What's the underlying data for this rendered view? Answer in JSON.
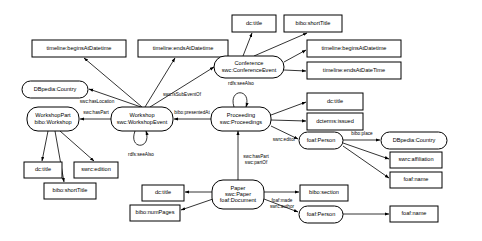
{
  "diagram": {
    "colors": {
      "stroke": "#000000",
      "fill": "#ffffff",
      "text": "#000000"
    },
    "nodes": [
      {
        "id": "dc_title_conf",
        "shape": "rect",
        "x": 232,
        "y": 15,
        "w": 44,
        "h": 17,
        "lines": [
          "dc:title"
        ]
      },
      {
        "id": "bibo_short_conf",
        "shape": "rect",
        "x": 284,
        "y": 15,
        "w": 58,
        "h": 17,
        "lines": [
          "bibo:shortTitle"
        ]
      },
      {
        "id": "tl_begins_left",
        "shape": "rect",
        "x": 32,
        "y": 40,
        "w": 94,
        "h": 17,
        "lines": [
          "timeline:beginsAtDatetime"
        ]
      },
      {
        "id": "tl_ends_left",
        "shape": "rect",
        "x": 138,
        "y": 40,
        "w": 90,
        "h": 17,
        "lines": [
          "timeline:endsAtDatetime"
        ]
      },
      {
        "id": "tl_begins_right",
        "shape": "rect",
        "x": 307,
        "y": 40,
        "w": 94,
        "h": 17,
        "lines": [
          "timeline:beginsAtDatetime"
        ]
      },
      {
        "id": "tl_ends_right",
        "shape": "rect",
        "x": 307,
        "y": 62,
        "w": 94,
        "h": 17,
        "lines": [
          "timeline:endsAtDateTime"
        ]
      },
      {
        "id": "conference",
        "shape": "round",
        "x": 214,
        "y": 56,
        "w": 70,
        "h": 22,
        "lines": [
          "Conference",
          "swc:ConferenceEvent"
        ]
      },
      {
        "id": "dbpedia_country_l",
        "shape": "round",
        "x": 22,
        "y": 81,
        "w": 66,
        "h": 17,
        "lines": [
          "DBpedia:Country"
        ]
      },
      {
        "id": "dc_title_proc",
        "shape": "rect",
        "x": 307,
        "y": 93,
        "w": 56,
        "h": 17,
        "lines": [
          "dc:title"
        ]
      },
      {
        "id": "dcterms_issued",
        "shape": "rect",
        "x": 307,
        "y": 113,
        "w": 56,
        "h": 17,
        "lines": [
          "dcterms:issued"
        ]
      },
      {
        "id": "workshop_part",
        "shape": "round",
        "x": 27,
        "y": 107,
        "w": 52,
        "h": 24,
        "lines": [
          "WorkshopPart",
          "bibo:Workshop"
        ]
      },
      {
        "id": "workshop",
        "shape": "round",
        "x": 111,
        "y": 107,
        "w": 62,
        "h": 24,
        "lines": [
          "Workshop",
          "swc:WorkshopEvent"
        ]
      },
      {
        "id": "proceeding",
        "shape": "round",
        "x": 211,
        "y": 107,
        "w": 60,
        "h": 24,
        "lines": [
          "Proceeding",
          "swc:Proceedings"
        ]
      },
      {
        "id": "foaf_person_ed",
        "shape": "round",
        "x": 299,
        "y": 132,
        "w": 44,
        "h": 17,
        "lines": [
          "foaf:Person"
        ]
      },
      {
        "id": "dbpedia_country_r",
        "shape": "round",
        "x": 381,
        "y": 132,
        "w": 66,
        "h": 17,
        "lines": [
          "DBpedia:Country"
        ]
      },
      {
        "id": "swrc_affiliation",
        "shape": "rect",
        "x": 390,
        "y": 152,
        "w": 52,
        "h": 16,
        "lines": [
          "swrc:affiliation"
        ]
      },
      {
        "id": "foaf_name_ed",
        "shape": "rect",
        "x": 390,
        "y": 172,
        "w": 52,
        "h": 16,
        "lines": [
          "foaf:name"
        ]
      },
      {
        "id": "dc_title_ws",
        "shape": "rect",
        "x": 24,
        "y": 162,
        "w": 38,
        "h": 16,
        "lines": [
          "dc:title"
        ]
      },
      {
        "id": "swrc_edition",
        "shape": "rect",
        "x": 74,
        "y": 162,
        "w": 44,
        "h": 16,
        "lines": [
          "swrc:edition"
        ]
      },
      {
        "id": "bibo_short_ws",
        "shape": "rect",
        "x": 44,
        "y": 183,
        "w": 52,
        "h": 16,
        "lines": [
          "bibo:shortTitle"
        ]
      },
      {
        "id": "dc_title_paper",
        "shape": "rect",
        "x": 142,
        "y": 185,
        "w": 42,
        "h": 16,
        "lines": [
          "dc:title"
        ]
      },
      {
        "id": "bibo_numpages",
        "shape": "rect",
        "x": 130,
        "y": 205,
        "w": 50,
        "h": 16,
        "lines": [
          "bibo:numPages"
        ]
      },
      {
        "id": "paper",
        "shape": "round",
        "x": 212,
        "y": 180,
        "w": 52,
        "h": 29,
        "lines": [
          "Paper",
          "swc:Paper",
          "foaf:Document"
        ]
      },
      {
        "id": "bibo_section",
        "shape": "rect",
        "x": 300,
        "y": 185,
        "w": 48,
        "h": 16,
        "lines": [
          "bibo:section"
        ]
      },
      {
        "id": "foaf_person_au",
        "shape": "round",
        "x": 299,
        "y": 206,
        "w": 44,
        "h": 17,
        "lines": [
          "foaf:Person"
        ]
      },
      {
        "id": "foaf_name_au",
        "shape": "rect",
        "x": 390,
        "y": 206,
        "w": 48,
        "h": 16,
        "lines": [
          "foaf:name"
        ]
      }
    ],
    "edges": [
      {
        "id": "e_conf_dctitle",
        "label": "",
        "path": "M 243 56 L 252 33",
        "arrow": "end"
      },
      {
        "id": "e_conf_shorttitle",
        "label": "",
        "path": "M 254 56 L 307 33",
        "arrow": "end"
      },
      {
        "id": "e_conf_begins",
        "label": "",
        "path": "M 284 62 L 306 50",
        "arrow": "end"
      },
      {
        "id": "e_conf_ends",
        "label": "",
        "path": "M 284 70 L 306 71",
        "arrow": "end"
      },
      {
        "id": "e_ws_begins",
        "label": "",
        "path": "M 142 107 L 84 58",
        "arrow": "end"
      },
      {
        "id": "e_ws_ends",
        "label": "",
        "path": "M 145 107 L 175 58",
        "arrow": "end"
      },
      {
        "id": "e_ws_conf",
        "label": "swc:isSubEventOf",
        "path": "M 150 107 L 214 67",
        "arrow": "end",
        "lx": 182,
        "ly": 95
      },
      {
        "id": "e_ws_country",
        "label": "swc:hasLocation",
        "path": "M 141 107 L 89 89",
        "arrow": "end",
        "lx": 97,
        "ly": 102
      },
      {
        "id": "e_ws_haspart",
        "label": "swc:hasPart",
        "path": "M 111 119 L 80 119",
        "arrow": "end",
        "lx": 96,
        "ly": 113
      },
      {
        "id": "e_ws_seealso",
        "label": "rdfs:seeAlso",
        "path": "M 135 131 C 128 150, 152 150, 146 131",
        "arrow": "end",
        "lx": 141,
        "ly": 155
      },
      {
        "id": "e_proc_ws",
        "label": "bibo:presentedAt",
        "path": "M 211 119 L 174 119",
        "arrow": "end",
        "lx": 192,
        "ly": 113
      },
      {
        "id": "e_proc_seealso",
        "label": "rdfs:seeAlso",
        "path": "M 234 107 C 228 88, 252 88, 246 107",
        "arrow": "end",
        "lx": 241,
        "ly": 84
      },
      {
        "id": "e_proc_dctitle",
        "label": "",
        "path": "M 271 115 L 306 102",
        "arrow": "end"
      },
      {
        "id": "e_proc_issued",
        "label": "",
        "path": "M 271 120 L 306 121",
        "arrow": "end"
      },
      {
        "id": "e_proc_editor",
        "label": "swrc:editor",
        "path": "M 271 126 L 298 139",
        "arrow": "end",
        "lx": 284,
        "ly": 140
      },
      {
        "id": "e_person_place",
        "label": "bibo:place",
        "path": "M 343 140 L 380 140",
        "arrow": "end",
        "lx": 362,
        "ly": 134
      },
      {
        "id": "e_person_affil",
        "label": "",
        "path": "M 343 143 L 389 159",
        "arrow": "end"
      },
      {
        "id": "e_person_name",
        "label": "",
        "path": "M 343 146 L 389 178",
        "arrow": "end"
      },
      {
        "id": "e_wp_dctitle",
        "label": "",
        "path": "M 48 131 L 42 161",
        "arrow": "end"
      },
      {
        "id": "e_wp_short",
        "label": "",
        "path": "M 55 131 L 64 182",
        "arrow": "end"
      },
      {
        "id": "e_wp_edition",
        "label": "",
        "path": "M 60 131 L 94 161",
        "arrow": "end"
      },
      {
        "id": "e_paper_proc",
        "label": "swc:hasPart\nswc:partOf",
        "path": "M 238 180 L 238 131",
        "arrow": "end",
        "lx": 256,
        "ly": 160
      },
      {
        "id": "e_paper_dctitle",
        "label": "",
        "path": "M 212 192 L 185 192",
        "arrow": "end"
      },
      {
        "id": "e_paper_numpages",
        "label": "",
        "path": "M 213 199 L 181 210",
        "arrow": "end"
      },
      {
        "id": "e_paper_section",
        "label": "",
        "path": "M 264 192 L 299 192",
        "arrow": "end"
      },
      {
        "id": "e_paper_author",
        "label": "foaf:made\nswrc:author",
        "path": "M 264 199 L 298 212",
        "arrow": "end",
        "lx": 282,
        "ly": 204
      },
      {
        "id": "e_author_name",
        "label": "",
        "path": "M 343 214 L 389 214",
        "arrow": "end"
      }
    ]
  }
}
